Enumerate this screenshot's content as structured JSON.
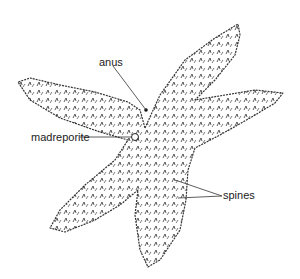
{
  "diagram": {
    "labels": [
      {
        "id": "anus",
        "text": "anus",
        "x": 99,
        "y": 57
      },
      {
        "id": "madreporite",
        "text": "madreporite",
        "x": 31,
        "y": 132
      },
      {
        "id": "spines",
        "text": "spines",
        "x": 223,
        "y": 190
      }
    ]
  }
}
